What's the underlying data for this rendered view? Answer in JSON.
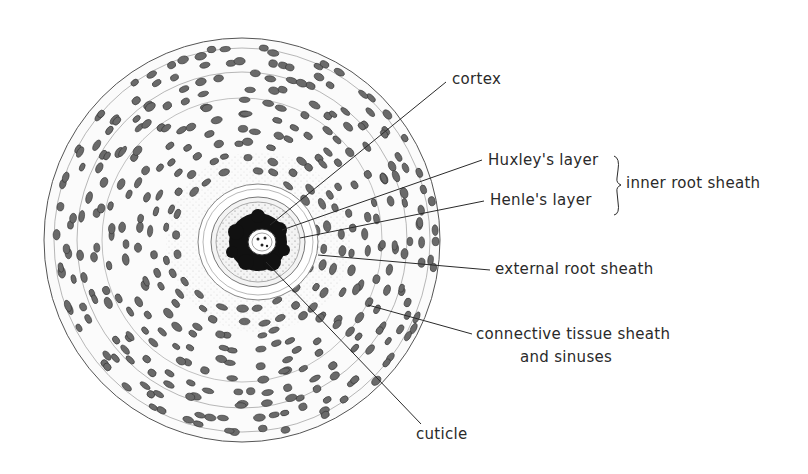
{
  "figure": {
    "background": "#ffffff",
    "ink_color": "#2a2a2a"
  },
  "labels": {
    "cortex": "cortex",
    "huxley": "Huxley's layer",
    "henle": "Henle's layer",
    "inner_root_sheath": "inner root sheath",
    "external_root_sheath": "external root sheath",
    "connective_line1": "connective tissue sheath",
    "connective_line2": "and sinuses",
    "cuticle": "cuticle"
  }
}
